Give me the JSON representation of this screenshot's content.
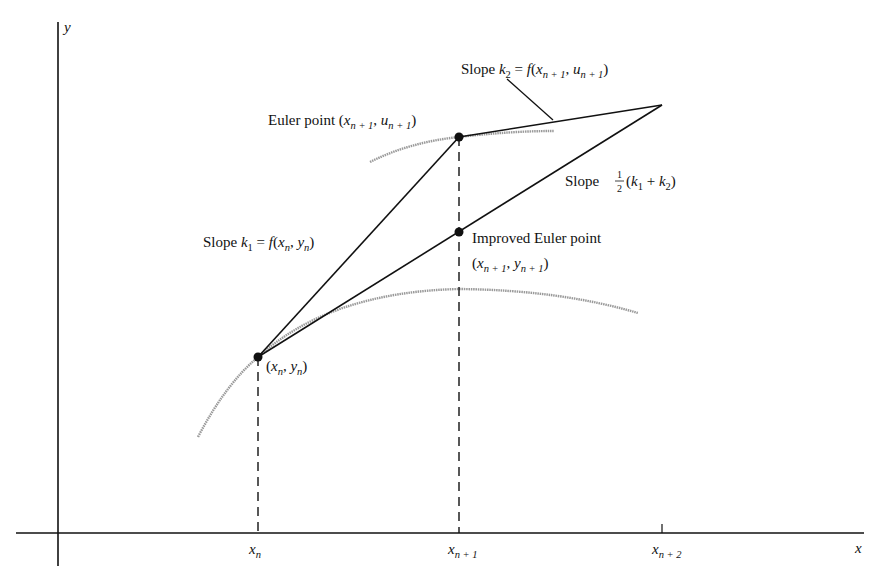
{
  "diagram": {
    "axes": {
      "x_label": "x",
      "y_label": "y",
      "x_ticks": [
        {
          "base": "x",
          "sub": "n"
        },
        {
          "base": "x",
          "sub": "n + 1"
        },
        {
          "base": "x",
          "sub": "n + 2"
        }
      ]
    },
    "points": {
      "start": {
        "label": "(x_n, y_n)",
        "x_base": "x",
        "x_sub": "n",
        "y_base": "y",
        "y_sub": "n"
      },
      "euler": {
        "prefix": "Euler point",
        "x_base": "x",
        "x_sub": "n + 1",
        "y_base": "u",
        "y_sub": "n + 1"
      },
      "improved": {
        "line1": "Improved Euler point",
        "x_base": "x",
        "x_sub": "n + 1",
        "y_base": "y",
        "y_sub": "n + 1"
      }
    },
    "slopes": {
      "k1": {
        "prefix": "Slope",
        "k": "k",
        "k_sub": "1",
        "eq": " = ",
        "f": "f",
        "x_base": "x",
        "x_sub": "n",
        "y_base": "y",
        "y_sub": "n"
      },
      "k2": {
        "prefix": "Slope",
        "k": "k",
        "k_sub": "2",
        "eq": " = ",
        "f": "f",
        "x_base": "x",
        "x_sub": "n + 1",
        "y_base": "u",
        "y_sub": "n + 1"
      },
      "avg": {
        "prefix": "Slope",
        "frac_num": "1",
        "frac_den": "2",
        "k1": "k",
        "k1_sub": "1",
        "plus": " + ",
        "k2": "k",
        "k2_sub": "2"
      }
    },
    "colors": {
      "line": "#111111",
      "curve": "#9a9a9a",
      "background": "#ffffff"
    }
  }
}
